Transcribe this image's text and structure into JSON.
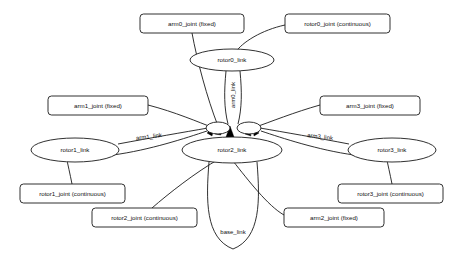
{
  "graph": {
    "title": "robot link and joint graph",
    "type": "directed-graph",
    "background_color": "#ffffff",
    "line_color": "#1a1a1a",
    "nodes": [
      {
        "id": "rotor0_link",
        "label": "rotor0_link",
        "shape": "ellipse",
        "cx": 232,
        "cy": 60,
        "rx": 42,
        "ry": 11
      },
      {
        "id": "rotor1_link",
        "label": "rotor1_link",
        "shape": "ellipse",
        "cx": 75,
        "cy": 150,
        "rx": 44,
        "ry": 12
      },
      {
        "id": "rotor2_link",
        "label": "rotor2_link",
        "shape": "ellipse",
        "cx": 232,
        "cy": 150,
        "rx": 50,
        "ry": 13
      },
      {
        "id": "rotor3_link",
        "label": "rotor3_link",
        "shape": "ellipse",
        "cx": 392,
        "cy": 150,
        "rx": 44,
        "ry": 12
      },
      {
        "id": "hub_left",
        "label": "",
        "shape": "ellipse",
        "cx": 218,
        "cy": 128,
        "rx": 12,
        "ry": 6
      },
      {
        "id": "hub_right",
        "label": "",
        "shape": "ellipse",
        "cx": 249,
        "cy": 128,
        "rx": 12,
        "ry": 6
      }
    ],
    "boxes": [
      {
        "id": "arm0_joint",
        "label": "arm0_joint (fixed)",
        "x": 140,
        "y": 14,
        "w": 104,
        "h": 19
      },
      {
        "id": "rotor0_joint",
        "label": "rotor0_joint (continuous)",
        "x": 285,
        "y": 14,
        "w": 105,
        "h": 19
      },
      {
        "id": "arm1_joint",
        "label": "arm1_joint (fixed)",
        "x": 48,
        "y": 96,
        "w": 100,
        "h": 19
      },
      {
        "id": "arm3_joint",
        "label": "arm3_joint (fixed)",
        "x": 320,
        "y": 96,
        "w": 100,
        "h": 19
      },
      {
        "id": "rotor1_joint",
        "label": "rotor1_joint (continuous)",
        "x": 20,
        "y": 184,
        "w": 105,
        "h": 19
      },
      {
        "id": "rotor3_joint",
        "label": "rotor3_joint (continuous)",
        "x": 338,
        "y": 184,
        "w": 105,
        "h": 19
      },
      {
        "id": "rotor2_joint",
        "label": "rotor2_joint (continuous)",
        "x": 92,
        "y": 208,
        "w": 105,
        "h": 19
      },
      {
        "id": "arm2_joint",
        "label": "arm2_joint (fixed)",
        "x": 284,
        "y": 208,
        "w": 100,
        "h": 19
      }
    ],
    "edge_labels": [
      {
        "id": "arm0_link",
        "label": "arm0_link",
        "x": 233,
        "y": 95,
        "rotated": true
      },
      {
        "id": "arm1_link",
        "label": "arm1_link",
        "x": 149,
        "y": 137,
        "rotated": false
      },
      {
        "id": "arm3_link",
        "label": "arm3_link",
        "x": 320,
        "y": 137,
        "rotated": false
      },
      {
        "id": "base_link",
        "label": "base_link",
        "x": 233,
        "y": 232,
        "rotated": false
      }
    ],
    "edges": [
      {
        "from": "arm0_joint",
        "to": "rotor2_link",
        "label": ""
      },
      {
        "from": "rotor0_joint",
        "to": "rotor0_link",
        "label": ""
      },
      {
        "from": "rotor0_link",
        "to": "rotor2_link",
        "label": "arm0_link"
      },
      {
        "from": "arm1_joint",
        "to": "rotor2_link",
        "label": ""
      },
      {
        "from": "arm3_joint",
        "to": "rotor2_link",
        "label": ""
      },
      {
        "from": "rotor1_link",
        "to": "rotor2_link",
        "label": "arm1_link"
      },
      {
        "from": "rotor3_link",
        "to": "rotor2_link",
        "label": "arm3_link"
      },
      {
        "from": "rotor1_joint",
        "to": "rotor1_link",
        "label": ""
      },
      {
        "from": "rotor3_joint",
        "to": "rotor3_link",
        "label": ""
      },
      {
        "from": "rotor2_joint",
        "to": "rotor2_link",
        "label": ""
      },
      {
        "from": "arm2_joint",
        "to": "rotor2_link",
        "label": ""
      },
      {
        "from": "rotor2_link",
        "to": "rotor2_link",
        "label": "base_link"
      }
    ]
  }
}
